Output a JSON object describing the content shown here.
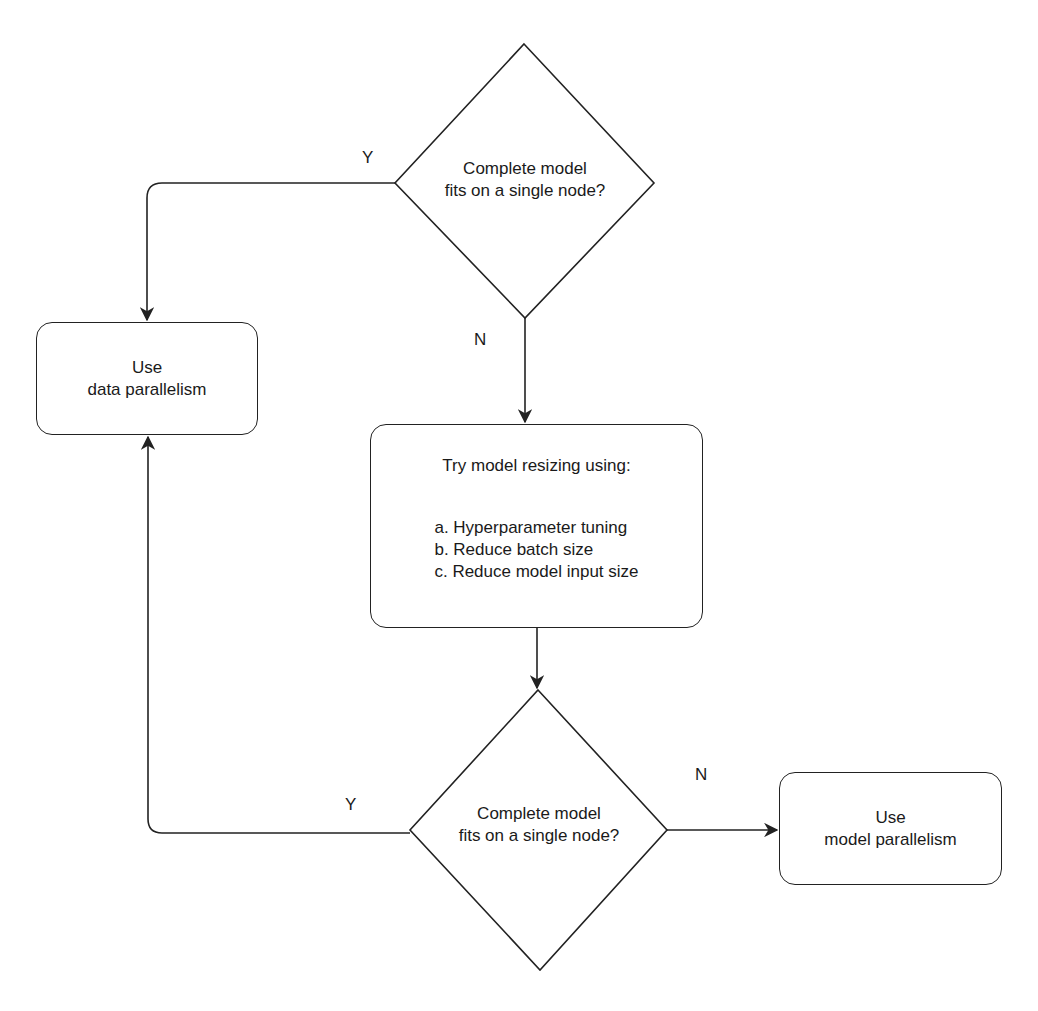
{
  "diagram": {
    "type": "flowchart",
    "nodes": {
      "decision1": {
        "shape": "diamond",
        "line1": "Complete model",
        "line2": "fits on a single node?"
      },
      "data_parallel": {
        "shape": "rounded-rect",
        "line1": "Use",
        "line2": "data parallelism"
      },
      "resize": {
        "shape": "rounded-rect",
        "title": "Try model resizing using:",
        "items": [
          "a. Hyperparameter tuning",
          "b. Reduce batch size",
          "c. Reduce model input size"
        ]
      },
      "decision2": {
        "shape": "diamond",
        "line1": "Complete model",
        "line2": "fits on a single node?"
      },
      "model_parallel": {
        "shape": "rounded-rect",
        "line1": "Use",
        "line2": "model parallelism"
      }
    },
    "edges": [
      {
        "from": "decision1",
        "to": "data_parallel",
        "label": "Y"
      },
      {
        "from": "decision1",
        "to": "resize",
        "label": "N"
      },
      {
        "from": "resize",
        "to": "decision2",
        "label": ""
      },
      {
        "from": "decision2",
        "to": "data_parallel",
        "label": "Y"
      },
      {
        "from": "decision2",
        "to": "model_parallel",
        "label": "N"
      }
    ],
    "labels": {
      "y1": "Y",
      "n1": "N",
      "y2": "Y",
      "n2": "N"
    },
    "stroke_color": "#222222"
  }
}
